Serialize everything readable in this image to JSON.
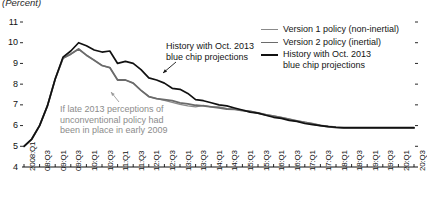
{
  "title": "(Percent)",
  "annotations": [
    {
      "id": "history-annotation",
      "line1": "History with Oct. 2013",
      "line2": "blue chip projections"
    },
    {
      "id": "counterfactual-annotation",
      "line1": "If late 2013 perceptions of",
      "line2": "unconventional policy had",
      "line3": "been in place in early 2009"
    }
  ],
  "legend": {
    "position": "top-right",
    "items": [
      {
        "label": "Version 1 policy (non-inertial)",
        "color": "#8a8a8a",
        "swatch": "sw-v1"
      },
      {
        "label": "Version 2 policy (inertial)",
        "color": "#6b6b6b",
        "swatch": "sw-v2"
      },
      {
        "label": "History with Oct. 2013",
        "label2": "blue chip projections",
        "color": "#111111",
        "swatch": "sw-hist"
      }
    ]
  },
  "chart_data": {
    "type": "line",
    "title": "(Percent)",
    "xlabel": "",
    "ylabel": "(Percent)",
    "ylim": [
      4,
      11
    ],
    "yticks": [
      4,
      5,
      6,
      7,
      8,
      9,
      10,
      11
    ],
    "grid": false,
    "legend_position": "top-right",
    "x": [
      "2008:Q1",
      "08:Q2",
      "08:Q3",
      "08:Q4",
      "09:Q1",
      "09:Q2",
      "09:Q3",
      "09:Q4",
      "10:Q1",
      "10:Q2",
      "10:Q3",
      "10:Q4",
      "11:Q1",
      "11:Q2",
      "11:Q3",
      "11:Q4",
      "12:Q1",
      "12:Q2",
      "12:Q3",
      "12:Q4",
      "13:Q1",
      "13:Q2",
      "13:Q3",
      "13:Q4",
      "14:Q1",
      "14:Q2",
      "14:Q3",
      "14:Q4",
      "15:Q1",
      "15:Q2",
      "15:Q3",
      "15:Q4",
      "16:Q1",
      "16:Q2",
      "16:Q3",
      "16:Q4",
      "17:Q1",
      "17:Q2",
      "17:Q3",
      "17:Q4",
      "18:Q1",
      "18:Q2",
      "18:Q3",
      "18:Q4",
      "19:Q1",
      "19:Q2",
      "19:Q3",
      "19:Q4",
      "20:Q1",
      "20:Q2",
      "20:Q3"
    ],
    "xticks_shown": [
      "2008:Q1",
      "08:Q3",
      "09:Q1",
      "09:Q3",
      "10:Q1",
      "10:Q3",
      "11:Q1",
      "11:Q3",
      "12:Q1",
      "12:Q3",
      "13:Q1",
      "13:Q3",
      "14:Q1",
      "14:Q3",
      "15:Q1",
      "15:Q3",
      "16:Q1",
      "16:Q3",
      "17:Q1",
      "17:Q3",
      "18:Q1",
      "18:Q3",
      "19:Q1",
      "19:Q3",
      "20:Q1",
      "20:Q3"
    ],
    "series": [
      {
        "name": "History with Oct. 2013 blue chip projections",
        "color": "#111111",
        "width": 1.7,
        "values": [
          5.0,
          5.35,
          6.0,
          6.95,
          8.25,
          9.3,
          9.6,
          10.0,
          9.85,
          9.65,
          9.55,
          9.6,
          9.0,
          9.1,
          9.0,
          8.7,
          8.3,
          8.2,
          8.05,
          7.8,
          7.75,
          7.55,
          7.25,
          7.2,
          7.1,
          7.0,
          6.95,
          6.85,
          6.75,
          6.65,
          6.6,
          6.5,
          6.4,
          6.35,
          6.25,
          6.2,
          6.1,
          6.05,
          6.0,
          5.95,
          5.92,
          5.9,
          5.9,
          5.9,
          5.9,
          5.9,
          5.9,
          5.9,
          5.9,
          5.9,
          5.9
        ]
      },
      {
        "name": "Version 2 policy (inertial)",
        "color": "#6b6b6b",
        "width": 1.8,
        "values": [
          5.0,
          5.35,
          6.0,
          6.95,
          8.25,
          9.25,
          9.45,
          9.7,
          9.4,
          9.15,
          8.9,
          8.8,
          8.2,
          8.2,
          8.05,
          7.7,
          7.4,
          7.3,
          7.25,
          7.2,
          7.1,
          7.05,
          6.98,
          6.95,
          6.9,
          6.85,
          6.8,
          6.78,
          6.72,
          6.68,
          6.6,
          6.52,
          6.45,
          6.38,
          6.3,
          6.22,
          6.15,
          6.08,
          6.0,
          5.95,
          5.9,
          5.88,
          5.88,
          5.88,
          5.88,
          5.88,
          5.88,
          5.88,
          5.88,
          5.88,
          5.88
        ]
      },
      {
        "name": "Version 1 policy (non-inertial)",
        "color": "#8a8a8a",
        "width": 1.3,
        "values": [
          5.0,
          5.35,
          6.0,
          6.95,
          8.25,
          9.25,
          9.45,
          9.7,
          9.4,
          9.15,
          8.9,
          8.8,
          8.2,
          8.2,
          8.05,
          7.7,
          7.4,
          7.3,
          7.22,
          7.12,
          7.02,
          6.95,
          6.9,
          6.98,
          6.9,
          6.9,
          6.82,
          6.8,
          6.74,
          6.7,
          6.62,
          6.54,
          6.47,
          6.4,
          6.32,
          6.24,
          6.16,
          6.1,
          6.02,
          5.97,
          5.93,
          5.9,
          5.9,
          5.9,
          5.9,
          5.9,
          5.9,
          5.9,
          5.9,
          5.9,
          5.9
        ]
      }
    ]
  }
}
